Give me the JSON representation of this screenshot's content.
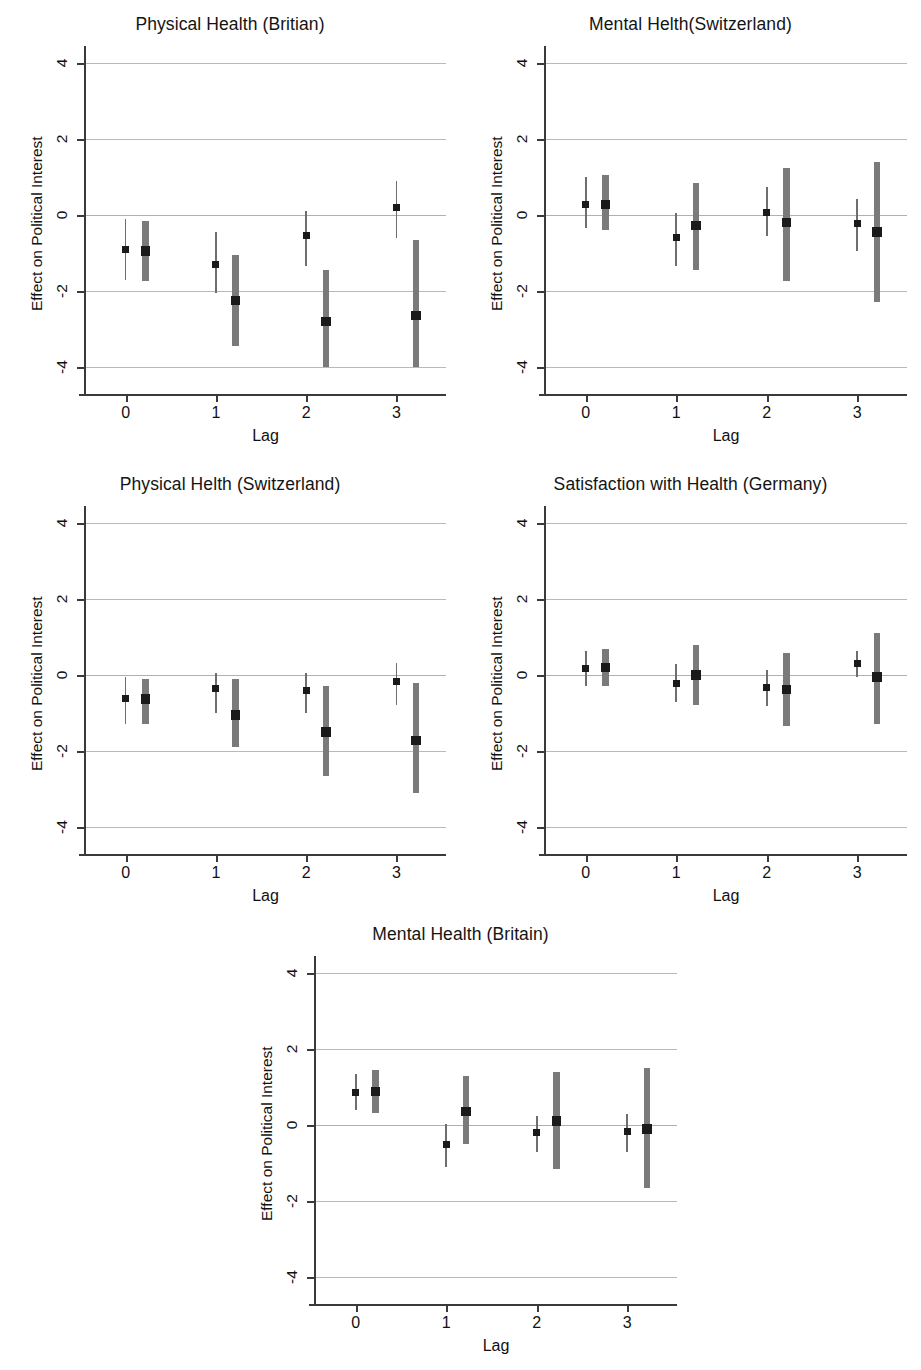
{
  "figure": {
    "axis_labels": {
      "y": "Effect on Political Interest",
      "x": "Lag"
    },
    "y_ticks": [
      "4",
      "2",
      "0",
      "-2",
      "-4"
    ],
    "x_ticks": [
      "0",
      "1",
      "2",
      "3"
    ],
    "colors": {
      "thin_interval": "#6e6e6e",
      "thick_interval": "#7a7a7a",
      "marker": "#1a1a1a",
      "gridline": "#b9b9b9",
      "axis": "#3a3a3a",
      "background": "#ffffff"
    }
  },
  "chart_data": [
    {
      "type": "scatter",
      "panel_index": 0,
      "title": "Physical Health (Britian)",
      "xlabel": "Lag",
      "ylabel": "Effect on Political Interest",
      "ylim": [
        -4.4,
        4.4
      ],
      "xlim": [
        -0.45,
        3.55
      ],
      "yticks": [
        4,
        2,
        0,
        -2,
        -4
      ],
      "xticks": [
        0,
        1,
        2,
        3
      ],
      "grid": true,
      "categories": [
        0,
        1,
        2,
        3
      ],
      "series": [
        {
          "name": "Estimate (narrow interval)",
          "style": "thin",
          "x_offset": 0.0,
          "values": [
            -0.9,
            -1.3,
            -0.55,
            0.2
          ],
          "ci_low": [
            -1.7,
            -2.05,
            -1.35,
            -0.6
          ],
          "ci_high": [
            -0.1,
            -0.45,
            0.1,
            0.9
          ]
        },
        {
          "name": "Estimate (wide interval)",
          "style": "thick",
          "x_offset": 0.22,
          "values": [
            -0.95,
            -2.25,
            -2.8,
            -2.65
          ],
          "ci_low": [
            -1.75,
            -3.45,
            -4.0,
            -4.0
          ],
          "ci_high": [
            -0.15,
            -1.05,
            -1.45,
            -0.65
          ]
        }
      ]
    },
    {
      "type": "scatter",
      "panel_index": 1,
      "title": "Mental Helth(Switzerland)",
      "xlabel": "Lag",
      "ylabel": "Effect on Political Interest",
      "ylim": [
        -4.4,
        4.4
      ],
      "xlim": [
        -0.45,
        3.55
      ],
      "yticks": [
        4,
        2,
        0,
        -2,
        -4
      ],
      "xticks": [
        0,
        1,
        2,
        3
      ],
      "grid": true,
      "categories": [
        0,
        1,
        2,
        3
      ],
      "series": [
        {
          "name": "Estimate (narrow interval)",
          "style": "thin",
          "x_offset": 0.0,
          "values": [
            0.27,
            -0.6,
            0.07,
            -0.22
          ],
          "ci_low": [
            -0.35,
            -1.35,
            -0.55,
            -0.95
          ],
          "ci_high": [
            1.0,
            0.05,
            0.75,
            0.42
          ]
        },
        {
          "name": "Estimate (wide interval)",
          "style": "thick",
          "x_offset": 0.22,
          "values": [
            0.28,
            -0.28,
            -0.2,
            -0.45
          ],
          "ci_low": [
            -0.4,
            -1.45,
            -1.75,
            -2.3
          ],
          "ci_high": [
            1.05,
            0.85,
            1.25,
            1.4
          ]
        }
      ]
    },
    {
      "type": "scatter",
      "panel_index": 2,
      "title": "Physical Helth (Switzerland)",
      "xlabel": "Lag",
      "ylabel": "Effect on Political Interest",
      "ylim": [
        -4.4,
        4.4
      ],
      "xlim": [
        -0.45,
        3.55
      ],
      "yticks": [
        4,
        2,
        0,
        -2,
        -4
      ],
      "xticks": [
        0,
        1,
        2,
        3
      ],
      "grid": true,
      "categories": [
        0,
        1,
        2,
        3
      ],
      "series": [
        {
          "name": "Estimate (narrow interval)",
          "style": "thin",
          "x_offset": 0.0,
          "values": [
            -0.62,
            -0.35,
            -0.42,
            -0.17
          ],
          "ci_low": [
            -1.3,
            -1.0,
            -1.0,
            -0.78
          ],
          "ci_high": [
            -0.05,
            0.05,
            0.05,
            0.32
          ]
        },
        {
          "name": "Estimate (wide interval)",
          "style": "thick",
          "x_offset": 0.22,
          "values": [
            -0.63,
            -1.05,
            -1.5,
            -1.72
          ],
          "ci_low": [
            -1.3,
            -1.9,
            -2.65,
            -3.1
          ],
          "ci_high": [
            -0.1,
            -0.1,
            -0.3,
            -0.2
          ]
        }
      ]
    },
    {
      "type": "scatter",
      "panel_index": 3,
      "title": "Satisfaction with Health (Germany)",
      "xlabel": "Lag",
      "ylabel": "Effect on Political Interest",
      "ylim": [
        -4.4,
        4.4
      ],
      "xlim": [
        -0.45,
        3.55
      ],
      "yticks": [
        4,
        2,
        0,
        -2,
        -4
      ],
      "xticks": [
        0,
        1,
        2,
        3
      ],
      "grid": true,
      "categories": [
        0,
        1,
        2,
        3
      ],
      "series": [
        {
          "name": "Estimate (narrow interval)",
          "style": "thin",
          "x_offset": 0.0,
          "values": [
            0.18,
            -0.22,
            -0.33,
            0.3
          ],
          "ci_low": [
            -0.28,
            -0.7,
            -0.82,
            -0.05
          ],
          "ci_high": [
            0.62,
            0.28,
            0.12,
            0.62
          ]
        },
        {
          "name": "Estimate (wide interval)",
          "style": "thick",
          "x_offset": 0.22,
          "values": [
            0.2,
            0.0,
            -0.38,
            -0.05
          ],
          "ci_low": [
            -0.3,
            -0.78,
            -1.35,
            -1.28
          ],
          "ci_high": [
            0.68,
            0.78,
            0.57,
            1.1
          ]
        }
      ]
    },
    {
      "type": "scatter",
      "panel_index": 4,
      "title": "Mental Health (Britain)",
      "xlabel": "Lag",
      "ylabel": "Effect on Political Interest",
      "ylim": [
        -4.4,
        4.4
      ],
      "xlim": [
        -0.45,
        3.55
      ],
      "yticks": [
        4,
        2,
        0,
        -2,
        -4
      ],
      "xticks": [
        0,
        1,
        2,
        3
      ],
      "grid": true,
      "categories": [
        0,
        1,
        2,
        3
      ],
      "series": [
        {
          "name": "Estimate (narrow interval)",
          "style": "thin",
          "x_offset": 0.0,
          "values": [
            0.85,
            -0.52,
            -0.2,
            -0.18
          ],
          "ci_low": [
            0.4,
            -1.1,
            -0.72,
            -0.7
          ],
          "ci_high": [
            1.35,
            0.02,
            0.25,
            0.28
          ]
        },
        {
          "name": "Estimate (wide interval)",
          "style": "thick",
          "x_offset": 0.22,
          "values": [
            0.88,
            0.35,
            0.1,
            -0.1
          ],
          "ci_low": [
            0.32,
            -0.5,
            -1.15,
            -1.65
          ],
          "ci_high": [
            1.45,
            1.3,
            1.4,
            1.5
          ]
        }
      ]
    }
  ]
}
